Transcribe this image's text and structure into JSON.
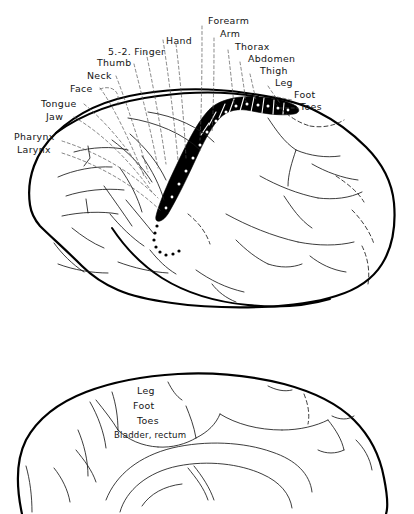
{
  "figure": {
    "panels": [
      {
        "id": "lateral",
        "name": "Lateral view of cerebral hemisphere"
      },
      {
        "id": "medial",
        "name": "Medial view of cerebral hemisphere"
      }
    ],
    "colors": {
      "ink": "#111111",
      "outline": "#000000",
      "strip": "#000000",
      "leader": "#555555",
      "background": "#ffffff"
    }
  },
  "lateral_panel": {
    "labels_left": [
      {
        "key": "pharynx",
        "text": "Pharynx",
        "x": 14,
        "y": 137
      },
      {
        "key": "larynx",
        "text": "Larynx",
        "x": 17,
        "y": 150
      },
      {
        "key": "tongue",
        "text": "Tongue",
        "x": 44,
        "y": 104
      },
      {
        "key": "jaw",
        "text": "Jaw",
        "x": 48,
        "y": 117
      },
      {
        "key": "face",
        "text": "Face",
        "x": 73,
        "y": 90
      },
      {
        "key": "neck",
        "text": "Neck",
        "x": 89,
        "y": 77
      },
      {
        "key": "thumb",
        "text": "Thumb",
        "x": 100,
        "y": 64
      },
      {
        "key": "fingers",
        "text": "5.-2. Finger",
        "x": 89,
        "y": 51
      },
      {
        "key": "hand",
        "text": "Hand",
        "x": 137,
        "y": 39
      }
    ],
    "labels_right": [
      {
        "key": "forearm",
        "text": "Forearm",
        "x": 180,
        "y": 20
      },
      {
        "key": "arm",
        "text": "Arm",
        "x": 195,
        "y": 33
      },
      {
        "key": "thorax",
        "text": "Thorax",
        "x": 212,
        "y": 45
      },
      {
        "key": "abdomen",
        "text": "Abdomen",
        "x": 226,
        "y": 58
      },
      {
        "key": "thigh",
        "text": "Thigh",
        "x": 238,
        "y": 70
      },
      {
        "key": "leg",
        "text": "Leg",
        "x": 255,
        "y": 83
      },
      {
        "key": "foot",
        "text": "Foot",
        "x": 275,
        "y": 94
      },
      {
        "key": "toes",
        "text": "Toes",
        "x": 285,
        "y": 106
      }
    ]
  },
  "medial_panel": {
    "labels": [
      {
        "key": "leg",
        "text": "Leg",
        "x": 134,
        "y": 391
      },
      {
        "key": "foot",
        "text": "Foot",
        "x": 131,
        "y": 406
      },
      {
        "key": "toes",
        "text": "Toes",
        "x": 135,
        "y": 421
      },
      {
        "key": "bladder_rectum",
        "text": "Bladder, rectum",
        "x": 116,
        "y": 436
      }
    ]
  },
  "strip": {
    "name": "central-sulcus-sensory-strip",
    "segment_count": 9,
    "description": "Blackened postcentral gyrus band with segment dividers and dots"
  }
}
